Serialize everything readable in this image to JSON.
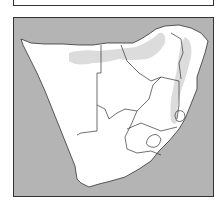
{
  "figure": {
    "type": "map",
    "region": "Southern Africa",
    "colors": {
      "ocean": "#b4b4b4",
      "land": "#ffffff",
      "shaded_region": "#d6d6d6",
      "border": "#333333"
    },
    "legend_box": {
      "visible": true,
      "text": ""
    },
    "features": [
      "country-borders",
      "coastline",
      "shaded-distribution-area-north",
      "shaded-distribution-area-east"
    ]
  }
}
